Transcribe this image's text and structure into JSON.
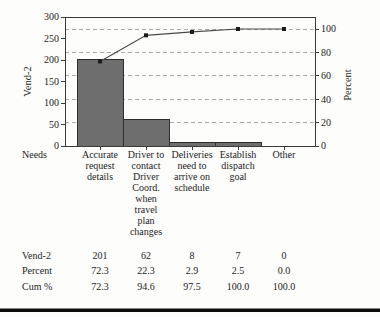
{
  "chart_data": {
    "type": "bar",
    "subtype": "pareto-with-cumulative-line",
    "title": "",
    "categories": [
      "Accurate request details",
      "Driver to contact Driver Coord. when travel plan changes",
      "Deliveries need to arrive on schedule",
      "Establish dispatch goal",
      "Other"
    ],
    "category_label_lines": [
      [
        "Accurate",
        "request",
        "details"
      ],
      [
        "Driver to",
        "contact",
        "Driver",
        "Coord.",
        "when",
        "travel",
        "plan",
        "changes"
      ],
      [
        "Deliveries",
        "need to",
        "arrive on",
        "schedule"
      ],
      [
        "Establish",
        "dispatch",
        "goal"
      ],
      [
        "Other"
      ]
    ],
    "series": [
      {
        "name": "Vend-2",
        "type": "bar",
        "axis": "left",
        "values": [
          201,
          62,
          8,
          7,
          0
        ]
      },
      {
        "name": "Cum %",
        "type": "line",
        "axis": "right",
        "values": [
          72.3,
          94.6,
          97.5,
          100.0,
          100.0
        ]
      }
    ],
    "left_axis": {
      "title": "Vend-2",
      "min": 0,
      "max": 300,
      "tick_step": 50,
      "ticks": [
        0,
        50,
        100,
        150,
        200,
        250,
        300
      ]
    },
    "right_axis": {
      "title": "Percent",
      "min": 0,
      "max": 100,
      "tick_step": 20,
      "ticks": [
        0,
        20,
        40,
        60,
        80,
        100
      ]
    },
    "x_axis": {
      "title": "Needs"
    },
    "grid": {
      "horizontal_dashed_at_right_ticks": [
        20,
        40,
        60,
        80,
        100
      ]
    },
    "legend_position": "none"
  },
  "table": {
    "rows": [
      {
        "label": "Vend-2",
        "values": [
          "201",
          "62",
          "8",
          "7",
          "0"
        ]
      },
      {
        "label": "Percent",
        "values": [
          "72.3",
          "22.3",
          "2.9",
          "2.5",
          "0.0"
        ]
      },
      {
        "label": "Cum %",
        "values": [
          "72.3",
          "94.6",
          "97.5",
          "100.0",
          "100.0"
        ]
      }
    ]
  },
  "colors": {
    "bar_fill": "#6e6e6e",
    "bar_border": "#2e2e2e",
    "line": "#4a4a4a",
    "marker": "#1a1a1a",
    "grid": "#ababab",
    "axis": "#3a3a3a",
    "text": "#1c1c1c",
    "background": "#fdfdfc",
    "bottom_rule": "#0d0d0d"
  }
}
